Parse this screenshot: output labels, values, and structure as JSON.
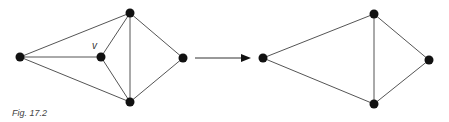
{
  "caption": "Fig. 17.2",
  "vertex_label": "v",
  "colors": {
    "edge": "#555555",
    "node": "#111111",
    "background": "#ffffff"
  },
  "left_graph": {
    "nodes": [
      {
        "id": "L",
        "x": 20,
        "y": 57
      },
      {
        "id": "T",
        "x": 130,
        "y": 13
      },
      {
        "id": "v",
        "x": 101,
        "y": 57,
        "label": "v"
      },
      {
        "id": "B",
        "x": 130,
        "y": 102
      },
      {
        "id": "R",
        "x": 183,
        "y": 58
      }
    ],
    "edges": [
      [
        "L",
        "T"
      ],
      [
        "L",
        "v"
      ],
      [
        "L",
        "B"
      ],
      [
        "v",
        "T"
      ],
      [
        "v",
        "B"
      ],
      [
        "T",
        "B"
      ],
      [
        "T",
        "R"
      ],
      [
        "B",
        "R"
      ]
    ]
  },
  "arrow": {
    "x1": 195,
    "y1": 58,
    "x2": 250,
    "y2": 58
  },
  "right_graph": {
    "nodes": [
      {
        "id": "L",
        "x": 263,
        "y": 58
      },
      {
        "id": "T",
        "x": 374,
        "y": 14
      },
      {
        "id": "B",
        "x": 374,
        "y": 104
      },
      {
        "id": "R",
        "x": 429,
        "y": 60
      }
    ],
    "edges": [
      [
        "L",
        "T"
      ],
      [
        "L",
        "B"
      ],
      [
        "T",
        "B"
      ],
      [
        "T",
        "R"
      ],
      [
        "B",
        "R"
      ]
    ]
  }
}
